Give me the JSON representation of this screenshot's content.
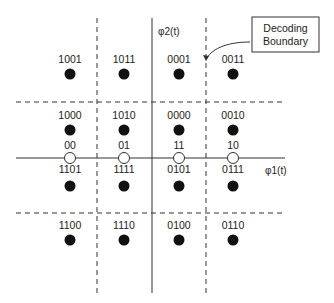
{
  "diagram": {
    "type": "16-QAM constellation with Gray-coded decoding regions",
    "axes": {
      "horizontal_label": "φ1(t)",
      "vertical_label": "φ2(t)"
    },
    "callout": {
      "line1": "Decoding",
      "line2": "Boundary"
    },
    "filled_points": [
      {
        "label": "1001",
        "col": 0,
        "row": 0
      },
      {
        "label": "1011",
        "col": 1,
        "row": 0
      },
      {
        "label": "0001",
        "col": 2,
        "row": 0
      },
      {
        "label": "0011",
        "col": 3,
        "row": 0
      },
      {
        "label": "1000",
        "col": 0,
        "row": 1
      },
      {
        "label": "1010",
        "col": 1,
        "row": 1
      },
      {
        "label": "0000",
        "col": 2,
        "row": 1
      },
      {
        "label": "0010",
        "col": 3,
        "row": 1
      },
      {
        "label": "1101",
        "col": 0,
        "row": 2
      },
      {
        "label": "1111",
        "col": 1,
        "row": 2
      },
      {
        "label": "0101",
        "col": 2,
        "row": 2
      },
      {
        "label": "0111",
        "col": 3,
        "row": 2
      },
      {
        "label": "1100",
        "col": 0,
        "row": 3
      },
      {
        "label": "1110",
        "col": 1,
        "row": 3
      },
      {
        "label": "0100",
        "col": 2,
        "row": 3
      },
      {
        "label": "0110",
        "col": 3,
        "row": 3
      }
    ],
    "axis_points": [
      {
        "label": "00",
        "col": 0
      },
      {
        "label": "01",
        "col": 1
      },
      {
        "label": "11",
        "col": 2
      },
      {
        "label": "10",
        "col": 3
      }
    ]
  }
}
